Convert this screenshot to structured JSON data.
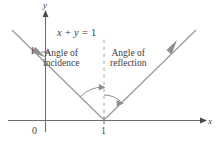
{
  "figure": {
    "equation_label": "x + y = 1",
    "axes": {
      "x_label": "x",
      "y_label": "y",
      "origin_label": "0",
      "x_tick_label": "1",
      "y_tick_label": "1"
    },
    "annotations": {
      "incidence_line1": "Angle of",
      "incidence_line2": "incidence",
      "reflection_line1": "Angle of",
      "reflection_line2": "reflection"
    },
    "colors": {
      "ray": "#9a9a9a",
      "axis": "#6e6e6e",
      "normal_dashed": "#a8a8a8",
      "text": "#3d3d3d",
      "background": "#ffffff"
    }
  },
  "chart_data": {
    "type": "line",
    "xlabel": "x",
    "ylabel": "y",
    "xlim": [
      -0.6,
      2.4
    ],
    "ylim": [
      -0.35,
      1.75
    ],
    "grid": false,
    "legend": null,
    "annotations": [
      {
        "text": "x + y = 1",
        "x": 0.35,
        "y": 1.32
      },
      {
        "text": "Angle of incidence",
        "x": 0.18,
        "y": 1.0
      },
      {
        "text": "Angle of reflection",
        "x": 1.15,
        "y": 1.0
      }
    ],
    "series": [
      {
        "name": "incident ray",
        "type": "line",
        "arrow": "end",
        "points": [
          [
            -0.45,
            1.45
          ],
          [
            1.0,
            0.0
          ]
        ]
      },
      {
        "name": "reflected ray",
        "type": "line",
        "arrow": "end",
        "points": [
          [
            1.0,
            0.0
          ],
          [
            2.3,
            1.3
          ]
        ]
      },
      {
        "name": "normal (dashed)",
        "type": "dashed-line",
        "points": [
          [
            1.0,
            0.0
          ],
          [
            1.0,
            1.25
          ]
        ]
      }
    ],
    "ticks": {
      "x": [
        0,
        1
      ],
      "y": [
        1
      ]
    }
  }
}
